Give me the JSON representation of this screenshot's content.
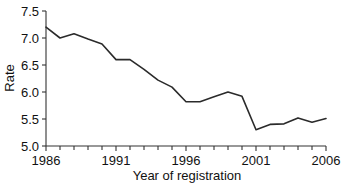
{
  "chart_data": {
    "type": "line",
    "title": "",
    "xlabel": "Year of registration",
    "ylabel": "Rate",
    "xlim": [
      1986,
      2006
    ],
    "ylim": [
      5.0,
      7.5
    ],
    "grid": false,
    "legend": false,
    "x": [
      1986,
      1987,
      1988,
      1989,
      1990,
      1991,
      1992,
      1993,
      1994,
      1995,
      1996,
      1997,
      1998,
      1999,
      2000,
      2001,
      2002,
      2003,
      2004,
      2005,
      2006
    ],
    "values": [
      7.2,
      7.0,
      7.08,
      6.98,
      6.89,
      6.6,
      6.6,
      6.42,
      6.22,
      6.09,
      5.82,
      5.82,
      5.91,
      6.0,
      5.92,
      5.3,
      5.4,
      5.41,
      5.52,
      5.44,
      5.51
    ],
    "series_name": "Rate",
    "line_color": "#2b2b2b",
    "xticks": [
      1986,
      1991,
      1996,
      2001,
      2006
    ],
    "xtick_labels": [
      "1986",
      "1991",
      "1996",
      "2001",
      "2006"
    ],
    "x_minor_tick_interval": 1,
    "yticks": [
      5.0,
      5.5,
      6.0,
      6.5,
      7.0,
      7.5
    ],
    "ytick_labels": [
      "5.0",
      "5.5",
      "6.0",
      "6.5",
      "7.0",
      "7.5"
    ]
  }
}
